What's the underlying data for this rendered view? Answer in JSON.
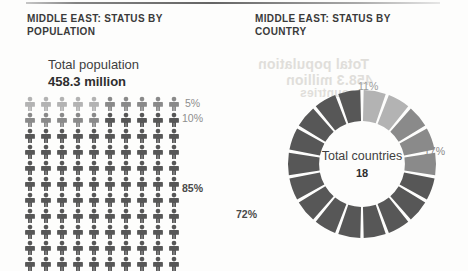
{
  "palette": {
    "dark": "#575757",
    "medium": "#8a8a8a",
    "light": "#b3b3b3",
    "page_background": "#fdfdfc",
    "text": "#3b3b3b"
  },
  "ghost_text": {
    "line1": "Total population",
    "line2": "458.3 million",
    "line3": "countries"
  },
  "left_panel": {
    "headline": "MIDDLE EAST: STATUS BY POPULATION",
    "total_label": "Total population",
    "total_value": "458.3 million",
    "labels": {
      "light": "5%",
      "medium": "10%",
      "dark": "85%"
    }
  },
  "right_panel": {
    "headline": "MIDDLE EAST: STATUS BY COUNTRY",
    "center_label": "Total countries",
    "center_value": "18",
    "labels": {
      "light": "11%",
      "medium": "17%",
      "dark": "72%"
    }
  },
  "chart_data": [
    {
      "type": "pictogram",
      "title": "MIDDLE EAST: STATUS BY POPULATION",
      "subtitle": "Total population",
      "total_label": "458.3 million",
      "total_value": 458.3,
      "total_units": "million",
      "icon": "person",
      "icons_total": 100,
      "columns": 10,
      "rows": 10,
      "categories": [
        "light",
        "medium",
        "dark"
      ],
      "values": [
        5,
        10,
        85
      ],
      "value_labels": [
        "5%",
        "10%",
        "85%"
      ],
      "colors": [
        "#b3b3b3",
        "#8a8a8a",
        "#575757"
      ],
      "xlabel": "",
      "ylabel": "",
      "grid": false,
      "legend": "right-of-grid"
    },
    {
      "type": "pie",
      "variant": "donut",
      "title": "MIDDLE EAST: STATUS BY COUNTRY",
      "center_label": "Total countries",
      "center_value": "18",
      "segments_total": 18,
      "categories": [
        "light",
        "medium",
        "dark"
      ],
      "values": [
        11,
        17,
        72
      ],
      "value_labels": [
        "11%",
        "17%",
        "72%"
      ],
      "segment_counts": [
        2,
        3,
        13
      ],
      "colors": [
        "#b3b3b3",
        "#8a8a8a",
        "#575757"
      ],
      "start_angle_deg": -90,
      "inner_radius_ratio": 0.58,
      "grid": false,
      "legend": "around-ring"
    }
  ]
}
